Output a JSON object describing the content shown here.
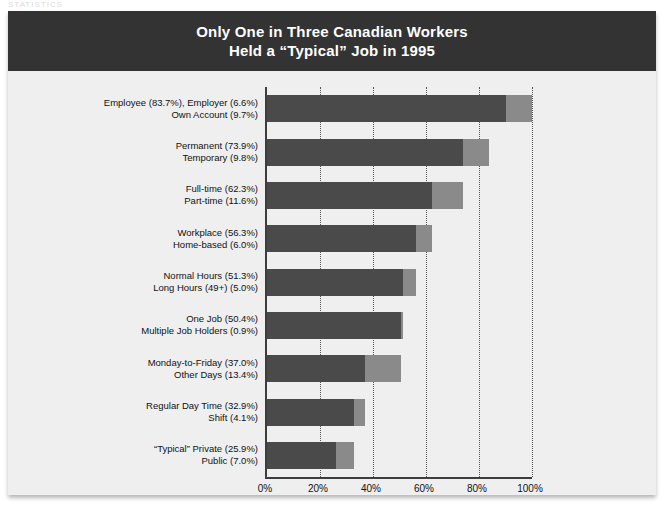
{
  "page": {
    "top_sliver_text": "STATISTICS"
  },
  "figure": {
    "title_lines": [
      "Only One in Three Canadian Workers",
      "Held a “Typical” Job in 1995"
    ],
    "colors": {
      "title_band": "#333333",
      "title_text": "#ffffff",
      "panel_background": "#efefef",
      "segment_primary": "#4a4a4a",
      "segment_secondary": "#8a8a8a",
      "axis": "#3d3d3d",
      "gridline": "#555555"
    }
  },
  "chart_data": {
    "type": "bar",
    "orientation": "horizontal",
    "stacked": true,
    "title": "Only One in Three Canadian Workers Held a “Typical” Job in 1995",
    "xlabel": "",
    "ylabel": "",
    "xlim": [
      0,
      100
    ],
    "xticks": [
      0,
      20,
      40,
      60,
      80,
      100
    ],
    "xtick_labels": [
      "0%",
      "20%",
      "40%",
      "60%",
      "80%",
      "100%"
    ],
    "grid": "vertical-dotted",
    "legend": "none",
    "categories": [
      {
        "label_lines": [
          "Employee (83.7%), Employer (6.6%)",
          "Own Account (9.7%)"
        ],
        "segments": [
          {
            "name": "Employee (83.7%), Employer (6.6%)",
            "value": 90.3
          },
          {
            "name": "Own Account (9.7%)",
            "value": 9.7
          }
        ]
      },
      {
        "label_lines": [
          "Permanent (73.9%)",
          "Temporary (9.8%)"
        ],
        "segments": [
          {
            "name": "Permanent",
            "value": 73.9
          },
          {
            "name": "Temporary",
            "value": 9.8
          }
        ]
      },
      {
        "label_lines": [
          "Full-time (62.3%)",
          "Part-time (11.6%)"
        ],
        "segments": [
          {
            "name": "Full-time",
            "value": 62.3
          },
          {
            "name": "Part-time",
            "value": 11.6
          }
        ]
      },
      {
        "label_lines": [
          "Workplace (56.3%)",
          "Home-based (6.0%)"
        ],
        "segments": [
          {
            "name": "Workplace",
            "value": 56.3
          },
          {
            "name": "Home-based",
            "value": 6.0
          }
        ]
      },
      {
        "label_lines": [
          "Normal Hours (51.3%)",
          "Long Hours (49+) (5.0%)"
        ],
        "segments": [
          {
            "name": "Normal Hours",
            "value": 51.3
          },
          {
            "name": "Long Hours (49+)",
            "value": 5.0
          }
        ]
      },
      {
        "label_lines": [
          "One Job (50.4%)",
          "Multiple Job Holders (0.9%)"
        ],
        "segments": [
          {
            "name": "One Job",
            "value": 50.4
          },
          {
            "name": "Multiple Job Holders",
            "value": 0.9
          }
        ]
      },
      {
        "label_lines": [
          "Monday-to-Friday (37.0%)",
          "Other Days (13.4%)"
        ],
        "segments": [
          {
            "name": "Monday-to-Friday",
            "value": 37.0
          },
          {
            "name": "Other Days",
            "value": 13.4
          }
        ]
      },
      {
        "label_lines": [
          "Regular Day Time (32.9%)",
          "Shift (4.1%)"
        ],
        "segments": [
          {
            "name": "Regular Day Time",
            "value": 32.9
          },
          {
            "name": "Shift",
            "value": 4.1
          }
        ]
      },
      {
        "label_lines": [
          "“Typical” Private (25.9%)",
          "Public (7.0%)"
        ],
        "segments": [
          {
            "name": "“Typical” Private",
            "value": 25.9
          },
          {
            "name": "Public",
            "value": 7.0
          }
        ]
      }
    ]
  }
}
